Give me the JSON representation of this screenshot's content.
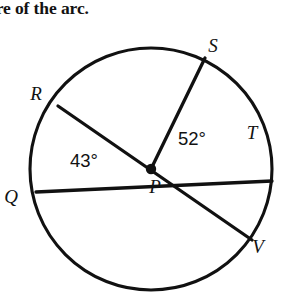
{
  "prompt": {
    "text": "ure of the arc."
  },
  "figure": {
    "name": "circle-with-center-P",
    "stroke_color": "#111111",
    "background_color": "#ffffff",
    "center": {
      "label": "P",
      "x": 151,
      "y": 169
    },
    "radius_px": 121,
    "points": [
      {
        "label": "S",
        "label_x": 213,
        "label_y": 52,
        "x": 205,
        "y": 58,
        "angle_deg": 64
      },
      {
        "label": "R",
        "label_x": 36,
        "label_y": 100,
        "x": 58,
        "y": 106,
        "angle_deg": 146
      },
      {
        "label": "T",
        "label_x": 252,
        "label_y": 139,
        "x": 272,
        "y": 181,
        "angle_deg": -6
      },
      {
        "label": "Q",
        "label_x": 11,
        "label_y": 203,
        "x": 36,
        "y": 192,
        "angle_deg": -174
      },
      {
        "label": "V",
        "label_x": 258,
        "label_y": 253,
        "x": 252,
        "y": 240,
        "angle_deg": -34
      }
    ],
    "segments": [
      {
        "name": "diameter-Q-T",
        "from": "Q",
        "to": "T"
      },
      {
        "name": "diameter-R-V",
        "from": "R",
        "to": "V"
      },
      {
        "name": "radius-P-S",
        "from": "P",
        "to": "S"
      }
    ],
    "angle_labels": [
      {
        "name": "angle-QPR",
        "value": "43°",
        "x": 70,
        "y": 167,
        "between": [
          "Q",
          "R"
        ]
      },
      {
        "name": "angle-SPT",
        "value": "52°",
        "x": 178,
        "y": 145,
        "between": [
          "S",
          "T"
        ]
      }
    ]
  }
}
